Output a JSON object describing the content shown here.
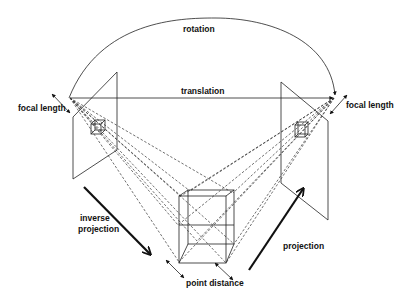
{
  "diagram": {
    "labels": {
      "rotation": "rotation",
      "translation": "translation",
      "focal_length_left": "focal length",
      "focal_length_right": "focal length",
      "inverse_projection_line1": "inverse",
      "inverse_projection_line2": "projection",
      "projection": "projection",
      "point_distance": "point distance"
    },
    "elements": [
      "left-camera-plane",
      "right-camera-plane",
      "3d-cube",
      "left-image-cube",
      "right-image-cube",
      "rotation-arc",
      "translation-arrow",
      "projection-rays"
    ]
  }
}
